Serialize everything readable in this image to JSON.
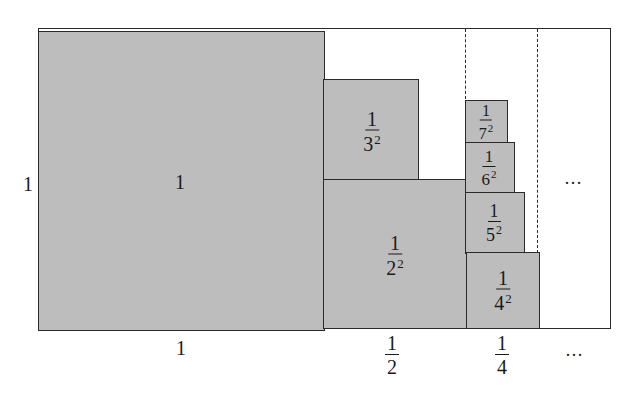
{
  "diagram": {
    "colors": {
      "fill": "#bdbdbd",
      "stroke": "#2a2a2a",
      "background": "#ffffff"
    },
    "side_label": "1",
    "bottom_labels": {
      "col1": "1",
      "col2_num": "1",
      "col2_den": "2",
      "col3_num": "1",
      "col3_den": "4",
      "ellipsis": "…"
    },
    "ellipsis_inner": "…",
    "squares": [
      {
        "id": "sq1",
        "label_main": "1"
      },
      {
        "id": "sq2",
        "num": "1",
        "base": "2",
        "exp": "2"
      },
      {
        "id": "sq3",
        "num": "1",
        "base": "3",
        "exp": "2"
      },
      {
        "id": "sq4",
        "num": "1",
        "base": "4",
        "exp": "2"
      },
      {
        "id": "sq5",
        "num": "1",
        "base": "5",
        "exp": "2"
      },
      {
        "id": "sq6",
        "num": "1",
        "base": "6",
        "exp": "2"
      },
      {
        "id": "sq7",
        "num": "1",
        "base": "7",
        "exp": "2"
      }
    ]
  }
}
